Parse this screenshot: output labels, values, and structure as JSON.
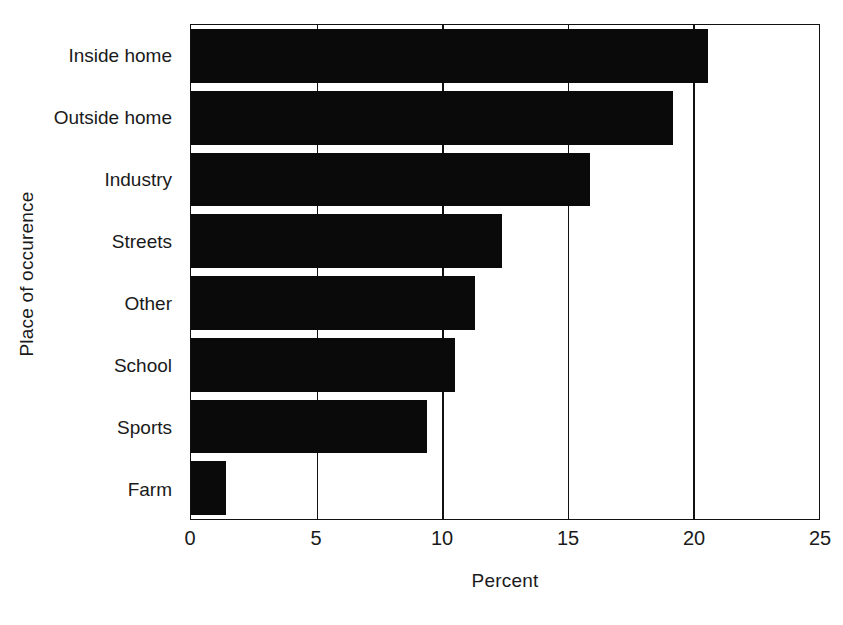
{
  "chart_data": {
    "type": "bar",
    "orientation": "horizontal",
    "title": "",
    "xlabel": "Percent",
    "ylabel": "Place of occurence",
    "categories": [
      "Inside home",
      "Outside home",
      "Industry",
      "Streets",
      "Other",
      "School",
      "Sports",
      "Farm"
    ],
    "values": [
      20.6,
      19.2,
      15.9,
      12.4,
      11.3,
      10.5,
      9.4,
      1.4
    ],
    "xlim": [
      0,
      25
    ],
    "xticks": [
      0,
      5,
      10,
      15,
      20,
      25
    ],
    "xtick_labels": [
      "0",
      "5",
      "10",
      "15",
      "20",
      "25"
    ],
    "grid": "vertical",
    "legend": "none",
    "bar_color": "#0a0a0a",
    "axis_color": "#111111",
    "background": "#ffffff"
  },
  "axes": {
    "y_title": "Place of occurence",
    "x_title": "Percent"
  }
}
